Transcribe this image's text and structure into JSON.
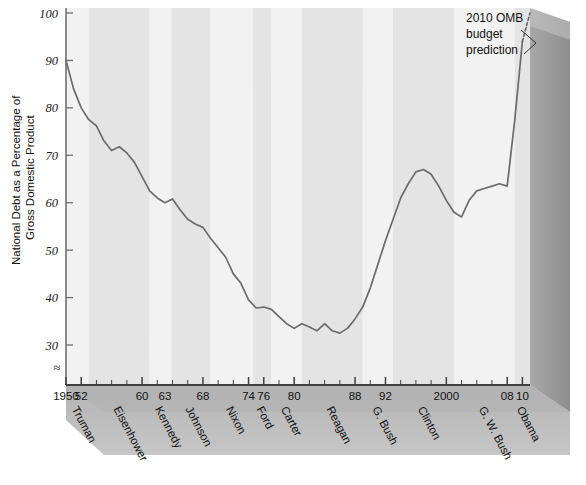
{
  "chart_data": {
    "type": "line",
    "title": "",
    "xlabel": "",
    "ylabel": "National Debt as a Percentage of Gross Domestic Product",
    "ylabel_line1": "National Debt as a Percentage of",
    "ylabel_line2": "Gross Domestic Product",
    "xlim": [
      1950,
      2011
    ],
    "ylim": [
      25,
      100
    ],
    "grid": false,
    "legend": null,
    "axis_break_symbol": "≈",
    "ytick_labels": [
      "100",
      "90",
      "80",
      "70",
      "60",
      "50",
      "40",
      "30"
    ],
    "ytick_values": [
      100,
      90,
      80,
      70,
      60,
      50,
      40,
      30
    ],
    "xtick_labels": [
      "1950",
      "52",
      "60",
      "63",
      "68",
      "74",
      "76",
      "80",
      "88",
      "92",
      "2000",
      "08",
      "10"
    ],
    "xtick_values": [
      1950,
      1952,
      1960,
      1963,
      1968,
      1974,
      1976,
      1980,
      1988,
      1992,
      2000,
      2008,
      2010
    ],
    "minor_tick_interval": 2,
    "annotations": [
      {
        "name": "omb-prediction",
        "line1": "2010 OMB",
        "line2": "budget",
        "line3": "prediction",
        "points_to_year": 2011,
        "points_to_value": 100
      }
    ],
    "president_bands": [
      {
        "name": "Truman",
        "start": 1950,
        "end": 1953,
        "shade": "light"
      },
      {
        "name": "Eisenhower",
        "start": 1953,
        "end": 1961,
        "shade": "dark"
      },
      {
        "name": "Kennedy",
        "start": 1961,
        "end": 1963.9,
        "shade": "light"
      },
      {
        "name": "Johnson",
        "start": 1963.9,
        "end": 1969,
        "shade": "dark"
      },
      {
        "name": "Nixon",
        "start": 1969,
        "end": 1974.6,
        "shade": "light"
      },
      {
        "name": "Ford",
        "start": 1974.6,
        "end": 1977,
        "shade": "dark"
      },
      {
        "name": "Carter",
        "start": 1977,
        "end": 1981,
        "shade": "light"
      },
      {
        "name": "Reagan",
        "start": 1981,
        "end": 1989,
        "shade": "dark"
      },
      {
        "name": "G. Bush",
        "start": 1989,
        "end": 1993,
        "shade": "light"
      },
      {
        "name": "Clinton",
        "start": 1993,
        "end": 2001,
        "shade": "dark"
      },
      {
        "name": "G. W. Bush",
        "start": 2001,
        "end": 2009,
        "shade": "light"
      },
      {
        "name": "Obama",
        "start": 2009,
        "end": 2011,
        "shade": "dark"
      }
    ],
    "series": [
      {
        "name": "National debt as % of GDP",
        "style": "solid",
        "color": "#6b6b6b",
        "x": [
          1950,
          1951,
          1952,
          1953,
          1954,
          1955,
          1956,
          1957,
          1958,
          1959,
          1960,
          1961,
          1962,
          1963,
          1964,
          1965,
          1966,
          1967,
          1968,
          1969,
          1970,
          1971,
          1972,
          1973,
          1974,
          1975,
          1976,
          1977,
          1978,
          1979,
          1980,
          1981,
          1982,
          1983,
          1984,
          1985,
          1986,
          1987,
          1988,
          1989,
          1990,
          1991,
          1992,
          1993,
          1994,
          1995,
          1996,
          1997,
          1998,
          1999,
          2000,
          2001,
          2002,
          2003,
          2004,
          2005,
          2006,
          2007,
          2008,
          2009,
          2010
        ],
        "y": [
          90.0,
          84.0,
          80.0,
          77.5,
          76.2,
          73.0,
          71.0,
          71.8,
          70.5,
          68.5,
          65.5,
          62.5,
          61.0,
          60.0,
          60.8,
          58.5,
          56.5,
          55.5,
          54.8,
          52.5,
          50.5,
          48.5,
          45.0,
          43.0,
          39.5,
          37.8,
          38.0,
          37.5,
          36.0,
          34.5,
          33.5,
          34.5,
          33.8,
          33.0,
          34.5,
          33.0,
          32.5,
          33.5,
          35.5,
          38.0,
          42.0,
          47.0,
          52.0,
          56.5,
          61.0,
          64.0,
          66.5,
          67.0,
          66.0,
          63.5,
          60.5,
          58.0,
          57.0,
          60.5,
          62.5,
          63.0,
          63.5,
          64.0,
          63.5,
          77.5,
          94.0
        ]
      },
      {
        "name": "2010 OMB budget prediction",
        "style": "dashed",
        "color": "#6b6b6b",
        "x": [
          2010,
          2011
        ],
        "y": [
          94.0,
          100.0
        ]
      }
    ],
    "colors": {
      "line": "#6b6b6b",
      "band_light": "#f2f2f2",
      "band_dark": "#e4e4e4",
      "plot_background": "#eeeeee",
      "axis": "#555555",
      "wall_right": "#9a9a9a",
      "floor": "#b7b7b7",
      "text": "#111111"
    }
  }
}
